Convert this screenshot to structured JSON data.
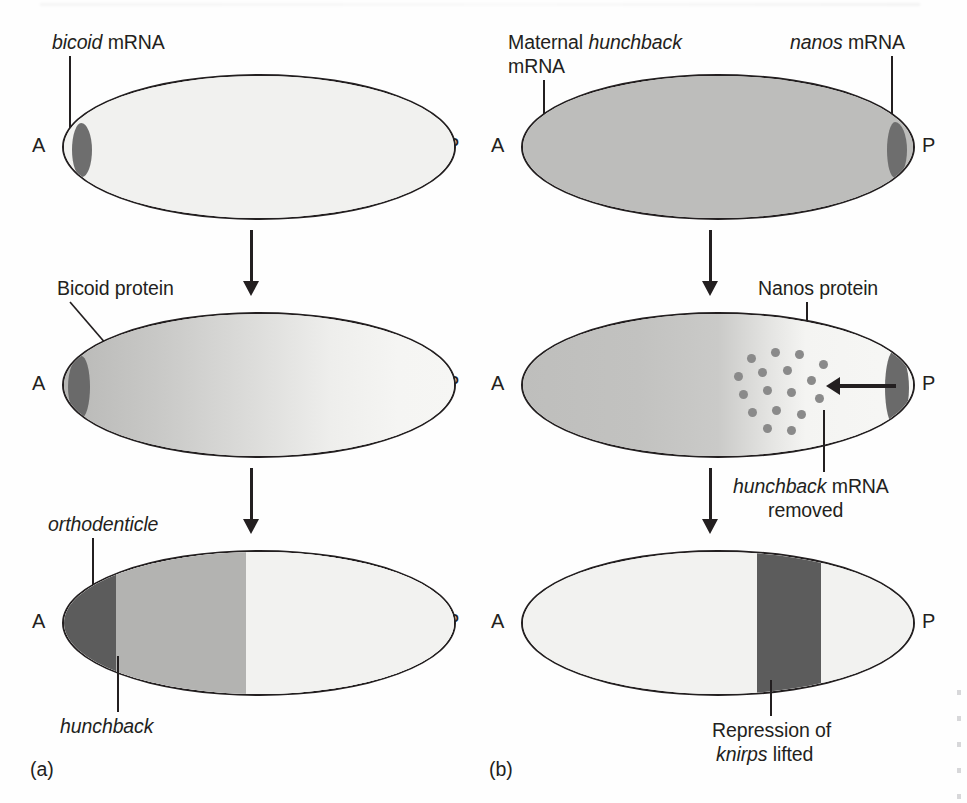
{
  "figure": {
    "type": "biology-diagram",
    "panels": [
      {
        "id": "a",
        "label": "(a)"
      },
      {
        "id": "b",
        "label": "(b)"
      }
    ]
  },
  "axis": {
    "anterior": "A",
    "posterior": "P"
  },
  "panel_a": {
    "id_label": "(a)",
    "stage1": {
      "label": "bicoid mRNA",
      "label_italic_part": "bicoid",
      "label_roman_part": " mRNA",
      "anterior": "A",
      "posterior": "P",
      "cytoplasm_color": "#f1f1ef",
      "localized_rna_color": "#6e6e6e"
    },
    "stage2": {
      "label": "Bicoid protein",
      "anterior": "A",
      "posterior": "P",
      "gradient_from": "#b8b8b6",
      "gradient_to": "#f4f4f2",
      "blob_color": "#6a6a6a"
    },
    "stage3": {
      "label_top": "orthodenticle",
      "label_bottom": "hunchback",
      "anterior": "A",
      "posterior": "P",
      "bands": [
        {
          "name": "orthodenticle",
          "color": "#5c5c5c",
          "start_pct": 0,
          "end_pct": 12
        },
        {
          "name": "hunchback",
          "color": "#b3b3b1",
          "start_pct": 12,
          "end_pct": 46
        },
        {
          "name": "posterior",
          "color": "#f2f2f0",
          "start_pct": 46,
          "end_pct": 100
        }
      ]
    }
  },
  "panel_b": {
    "id_label": "(b)",
    "stage1": {
      "label_left_line1": "Maternal hunchback",
      "label_left_line1_roman": "Maternal ",
      "label_left_line1_italic": "hunchback",
      "label_left_line2": "mRNA",
      "label_right": "nanos mRNA",
      "label_right_italic": "nanos",
      "label_right_roman": " mRNA",
      "anterior": "A",
      "posterior": "P",
      "cytoplasm_color": "#bdbdbb",
      "localized_rna_color": "#6e6e6e"
    },
    "stage2": {
      "label_nanos": "Nanos protein",
      "label_removed_line1": "hunchback mRNA",
      "label_removed_line1_italic": "hunchback",
      "label_removed_line1_roman": " mRNA",
      "label_removed_line2": "removed",
      "anterior": "A",
      "posterior": "P",
      "gradient_from": "#bebebc",
      "gradient_to": "#f6f6f4",
      "dot_color": "#8a8a8a",
      "dot_count": 17,
      "blob_color": "#6a6a6a"
    },
    "stage3": {
      "label_line1": "Repression of",
      "label_line2": "knirps lifted",
      "label_line2_italic": "knirps",
      "label_line2_roman": " lifted",
      "anterior": "A",
      "posterior": "P",
      "bands": [
        {
          "name": "anterior",
          "color": "#f2f2f0",
          "start_pct": 0,
          "end_pct": 60
        },
        {
          "name": "knirps",
          "color": "#5c5c5c",
          "start_pct": 60,
          "end_pct": 76
        },
        {
          "name": "posterior",
          "color": "#f2f2f0",
          "start_pct": 76,
          "end_pct": 100
        }
      ]
    }
  },
  "colors": {
    "ink": "#231f20",
    "dark_band": "#5c5c5c",
    "mid_band": "#b3b3b1",
    "light_band": "#f2f2f0",
    "rna_blob": "#6e6e6e",
    "dot": "#8a8a8a"
  }
}
